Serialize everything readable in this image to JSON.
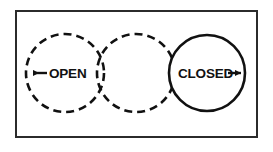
{
  "figure": {
    "kind": "valve-aperture-sequence-diagram",
    "background_color": "#ffffff",
    "stroke_color": "#111111",
    "frame": {
      "border_color": "#2b2b2b",
      "border_width_px": 2,
      "x": 15,
      "y": 10,
      "width": 243,
      "height": 128
    },
    "circles": [
      {
        "id": "circle-open",
        "style": "dashed",
        "cx": 65,
        "cy": 73,
        "r": 39,
        "dash_pattern": "8 5",
        "stroke_width": 2.6
      },
      {
        "id": "circle-middle",
        "style": "dashed",
        "cx": 136,
        "cy": 73,
        "r": 39,
        "dash_pattern": "8 5",
        "stroke_width": 2.6
      },
      {
        "id": "circle-closed",
        "style": "solid",
        "cx": 207,
        "cy": 73,
        "r": 38,
        "stroke_width": 2.6
      }
    ],
    "labels": {
      "open": {
        "text": "OPEN",
        "x": 49,
        "y": 78,
        "arrow_direction": "left",
        "arrow_name": "arrow-left-open"
      },
      "closed": {
        "text": "CLOSED",
        "x": 178,
        "y": 78,
        "arrow_direction": "right",
        "arrow_name": "arrow-right-closed"
      }
    },
    "arrows": {
      "open_arrow": {
        "tail_x": 47,
        "head_x": 31,
        "y": 73
      },
      "closed_arrow": {
        "tail_x": 227,
        "head_x": 243,
        "y": 73
      }
    }
  }
}
